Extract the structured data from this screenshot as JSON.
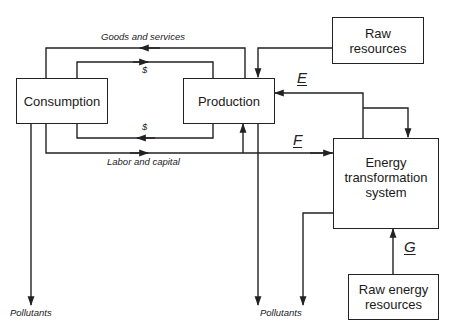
{
  "diagram": {
    "nodes": {
      "consumption": {
        "label": "Consumption"
      },
      "production": {
        "label": "Production"
      },
      "raw_resources": {
        "line1": "Raw",
        "line2": "resources"
      },
      "energy_system": {
        "line1": "Energy",
        "line2": "transformation",
        "line3": "system"
      },
      "raw_energy": {
        "line1": "Raw energy",
        "line2": "resources"
      }
    },
    "edge_labels": {
      "goods": "Goods and services",
      "dollar_top": "$",
      "dollar_bottom": "$",
      "labor": "Labor and capital",
      "pollutants_left": "Pollutants",
      "pollutants_right": "Pollutants"
    },
    "variables": {
      "e": "E",
      "f": "F",
      "g": "G"
    },
    "edges": [
      {
        "from": "production",
        "to": "consumption",
        "label": "Goods and services"
      },
      {
        "from": "consumption",
        "to": "production",
        "label": "$"
      },
      {
        "from": "production",
        "to": "consumption",
        "label": "$"
      },
      {
        "from": "consumption",
        "to": "production",
        "label": "Labor and capital"
      },
      {
        "from": "consumption",
        "to": "energy_system",
        "label": "F"
      },
      {
        "from": "raw_resources",
        "to": "production"
      },
      {
        "from": "energy_system",
        "to": "production",
        "label": "E"
      },
      {
        "from": "energy_system",
        "to": "energy_system",
        "label": "self-loop"
      },
      {
        "from": "raw_energy",
        "to": "energy_system",
        "label": "G"
      },
      {
        "from": "consumption",
        "to": "pollutants"
      },
      {
        "from": "production",
        "to": "pollutants"
      },
      {
        "from": "energy_system",
        "to": "pollutants"
      }
    ]
  }
}
